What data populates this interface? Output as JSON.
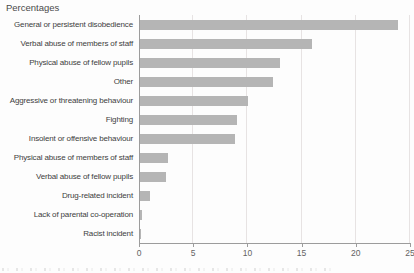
{
  "page": {
    "title": "Percentages"
  },
  "chart_data": {
    "type": "bar",
    "orientation": "horizontal",
    "title": "Percentages",
    "categories": [
      "General or persistent disobedience",
      "Verbal abuse of members of staff",
      "Physical abuse of fellow pupils",
      "Other",
      "Aggressive or threatening behaviour",
      "Fighting",
      "Insolent or offensive behaviour",
      "Physical abuse of members of staff",
      "Verbal abuse of fellow pupils",
      "Drug-related incident",
      "Lack of parental co-operation",
      "Racist incident"
    ],
    "values": [
      23.9,
      16.0,
      13.0,
      12.4,
      10.1,
      9.0,
      8.9,
      2.7,
      2.5,
      1.0,
      0.3,
      0.2
    ],
    "xlabel": "",
    "ylabel": "",
    "xlim": [
      0,
      25
    ],
    "xticks": [
      0,
      5,
      10,
      15,
      20,
      25
    ],
    "grid": "vertical-light",
    "legend": "none",
    "colors": {
      "bar": "#b5b5b5",
      "gridline": "#e7e3e3",
      "axis": "#9c9c9c",
      "tick_mark": "#9c9c9c",
      "tick_label": "#636363",
      "category_label": "#3d3d3d",
      "title": "#4a4a4a",
      "background": "#fdfdfd"
    }
  }
}
